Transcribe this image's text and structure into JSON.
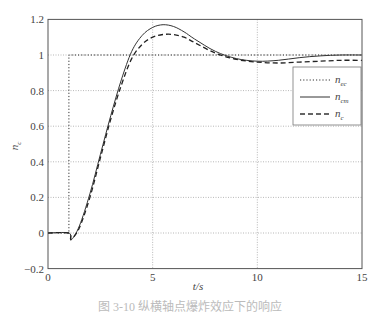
{
  "chart_data": {
    "type": "line",
    "title": "",
    "xlabel": "t/s",
    "ylabel": "n_c",
    "xlim": [
      0,
      15
    ],
    "ylim": [
      -0.2,
      1.2
    ],
    "xticks": [
      0,
      5,
      10,
      15
    ],
    "yticks": [
      -0.2,
      0,
      0.2,
      0.4,
      0.6,
      0.8,
      1,
      1.2
    ],
    "xtick_labels": [
      "0",
      "5",
      "10",
      "15"
    ],
    "ytick_labels": [
      "−0.2",
      "0",
      "0.2",
      "0.4",
      "0.6",
      "0.8",
      "1",
      "1.2"
    ],
    "grid": true,
    "legend_position": "right, inside",
    "legend": [
      {
        "name": "n_ec",
        "base": "n",
        "sub": "ec",
        "style": "dotted"
      },
      {
        "name": "n_cm",
        "base": "n",
        "sub": "cm",
        "style": "solid"
      },
      {
        "name": "n_c",
        "base": "n",
        "sub": "c",
        "style": "dashed"
      }
    ],
    "series": [
      {
        "name": "n_ec",
        "style": "dotted",
        "x": [
          0,
          1,
          1,
          15
        ],
        "y": [
          0,
          0,
          1,
          1
        ]
      },
      {
        "name": "n_cm",
        "style": "solid",
        "x": [
          0,
          1,
          1.1,
          1.5,
          2,
          2.5,
          3,
          3.5,
          4,
          4.5,
          5,
          5.5,
          6,
          6.5,
          7,
          8,
          9,
          10,
          11,
          12,
          13,
          14,
          15
        ],
        "y": [
          0,
          0,
          -0.04,
          0.04,
          0.22,
          0.44,
          0.66,
          0.86,
          1.02,
          1.11,
          1.155,
          1.17,
          1.16,
          1.13,
          1.09,
          1.02,
          0.98,
          0.965,
          0.97,
          0.985,
          0.995,
          1.0,
          1.0
        ]
      },
      {
        "name": "n_c",
        "style": "dashed",
        "x": [
          0,
          1,
          1.1,
          1.5,
          2,
          2.5,
          3,
          3.5,
          4,
          4.5,
          5,
          5.5,
          6,
          6.5,
          7,
          8,
          9,
          10,
          11,
          12,
          13,
          14,
          15
        ],
        "y": [
          0,
          0,
          -0.035,
          0.03,
          0.2,
          0.42,
          0.64,
          0.83,
          0.98,
          1.06,
          1.1,
          1.115,
          1.115,
          1.1,
          1.07,
          1.01,
          0.975,
          0.96,
          0.955,
          0.96,
          0.965,
          0.97,
          0.97
        ]
      }
    ]
  },
  "caption": {
    "text": "图 3-10 纵横轴点爆炸效应下的响应"
  }
}
